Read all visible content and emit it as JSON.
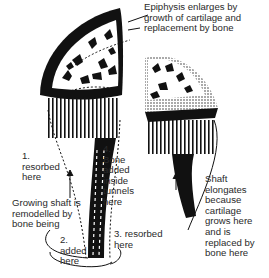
{
  "figure": {
    "labels": {
      "epiphysis": "Epiphysis enlarges by\ngrowth of cartilage and\nreplacement by bone",
      "step1": "1.\nresorbed\nhere",
      "step4": "4.\nBone\nadded\ninside\ntunnels\nhere",
      "remodel": "Growing shaft is\nremodelled by\nbone being",
      "step2": "2.\nadded\nhere",
      "step3": "3. resorbed\nhere",
      "shaft": "Shaft\nelongates\nbecause\ncartilage\ngrows here\nand is\nreplaced by\nbone here"
    },
    "colors": {
      "ink": "#111111",
      "background": "#ffffff"
    }
  }
}
